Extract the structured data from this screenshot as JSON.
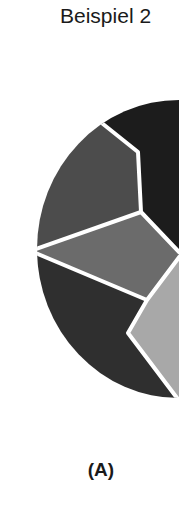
{
  "title": "Beispiel 2",
  "caption": "(A)",
  "diagram": {
    "type": "half-circle segmented diagram",
    "colors": {
      "top_right_segment": "#1c1c1c",
      "upper_left_segment": "#4c4c4c",
      "middle_segment": "#6b6b6b",
      "lower_left_segment": "#2f2f2f",
      "lower_right_wedge": "#a8a8a8",
      "separator": "#ffffff"
    }
  }
}
